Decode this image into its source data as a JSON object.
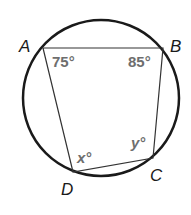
{
  "diagram": {
    "type": "inscribed-quadrilateral",
    "circle": {
      "cx": 101,
      "cy": 98,
      "r": 78
    },
    "vertices": [
      {
        "name": "A",
        "x": 43,
        "y": 48
      },
      {
        "name": "B",
        "x": 163,
        "y": 48
      },
      {
        "name": "C",
        "x": 153,
        "y": 158
      },
      {
        "name": "D",
        "x": 73,
        "y": 172
      }
    ],
    "labels": {
      "A": "A",
      "B": "B",
      "C": "C",
      "D": "D"
    },
    "angles": {
      "A": "75°",
      "B": "85°",
      "D_var": "x",
      "C_var": "y",
      "degree": "°"
    },
    "colors": {
      "stroke": "#1a1a1a",
      "angle_text": "#6e6e6e"
    }
  }
}
